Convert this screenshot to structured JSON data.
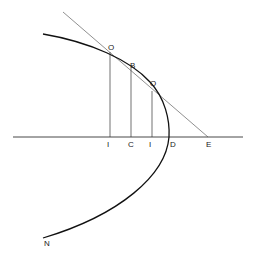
{
  "diagram": {
    "type": "geometric-construction",
    "labels": {
      "O_upper": "O",
      "B": "B",
      "O_lower": "O",
      "I_left": "I",
      "C": "C",
      "I_right": "I",
      "D": "D",
      "E": "E",
      "N": "N"
    },
    "colors": {
      "stroke": "#222222",
      "background": "#ffffff"
    }
  }
}
